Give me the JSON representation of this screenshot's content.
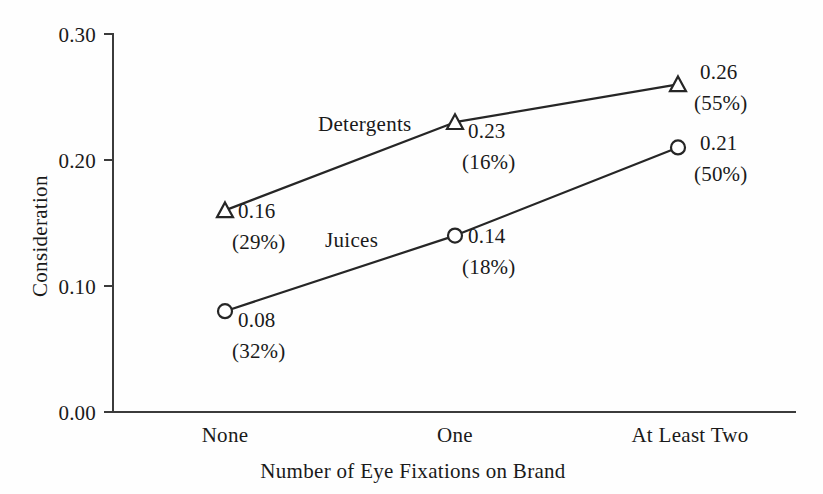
{
  "chart_data": {
    "type": "line",
    "title": "",
    "xlabel": "Number of Eye Fixations on Brand",
    "ylabel": "Consideration",
    "categories": [
      "None",
      "One",
      "At Least Two"
    ],
    "ylim": [
      0.0,
      0.3
    ],
    "yticks": [
      "0.00",
      "0.10",
      "0.20",
      "0.30"
    ],
    "ytick_values": [
      0.0,
      0.1,
      0.2,
      0.3
    ],
    "grid": false,
    "legend_position": "inline-labels",
    "series": [
      {
        "name": "Detergents",
        "marker": "triangle",
        "values": [
          0.16,
          0.23,
          0.26
        ],
        "value_labels": [
          "0.16",
          "0.23",
          "0.26"
        ],
        "percent_labels": [
          "(29%)",
          "(16%)",
          "(55%)"
        ]
      },
      {
        "name": "Juices",
        "marker": "circle",
        "values": [
          0.08,
          0.14,
          0.21
        ],
        "value_labels": [
          "0.08",
          "0.14",
          "0.21"
        ],
        "percent_labels": [
          "(32%)",
          "(18%)",
          "(50%)"
        ]
      }
    ],
    "annotations": [
      {
        "text": "Detergents",
        "series": "Detergents"
      },
      {
        "text": "Juices",
        "series": "Juices"
      }
    ],
    "colors": {
      "line": "#262626",
      "axis": "#3b3b3b",
      "text": "#1a1a1a",
      "background": "#fefefe",
      "marker_fill": "#ffffff"
    }
  },
  "labels": {
    "y_axis_title": "Consideration",
    "x_axis_title": "Number of Eye Fixations on Brand",
    "yticks": {
      "t3": "0.30",
      "t2": "0.20",
      "t1": "0.10",
      "t0": "0.00"
    },
    "xticks": {
      "c0": "None",
      "c1": "One",
      "c2": "At Least Two"
    },
    "series_names": {
      "detergents": "Detergents",
      "juices": "Juices"
    },
    "detergents": {
      "v0": "0.16",
      "p0": "(29%)",
      "v1": "0.23",
      "p1": "(16%)",
      "v2": "0.26",
      "p2": "(55%)"
    },
    "juices": {
      "v0": "0.08",
      "p0": "(32%)",
      "v1": "0.14",
      "p1": "(18%)",
      "v2": "0.21",
      "p2": "(50%)"
    }
  }
}
